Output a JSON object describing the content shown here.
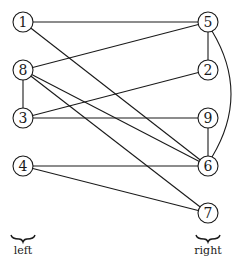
{
  "diagram": {
    "type": "bipartite-graph",
    "stroke_color": "#1a1a1a",
    "background": "#ffffff",
    "node_radius": 10,
    "nodes": [
      {
        "id": "1",
        "label": "1",
        "side": "left",
        "x": 23,
        "y": 22
      },
      {
        "id": "8",
        "label": "8",
        "side": "left",
        "x": 23,
        "y": 70
      },
      {
        "id": "3",
        "label": "3",
        "side": "left",
        "x": 23,
        "y": 118
      },
      {
        "id": "4",
        "label": "4",
        "side": "left",
        "x": 23,
        "y": 166
      },
      {
        "id": "5",
        "label": "5",
        "side": "right",
        "x": 208,
        "y": 22
      },
      {
        "id": "2",
        "label": "2",
        "side": "right",
        "x": 208,
        "y": 70
      },
      {
        "id": "9",
        "label": "9",
        "side": "right",
        "x": 208,
        "y": 118
      },
      {
        "id": "6",
        "label": "6",
        "side": "right",
        "x": 208,
        "y": 166
      },
      {
        "id": "7",
        "label": "7",
        "side": "right",
        "x": 208,
        "y": 213
      }
    ],
    "edges": [
      {
        "from": "1",
        "to": "5"
      },
      {
        "from": "1",
        "to": "6"
      },
      {
        "from": "8",
        "to": "5"
      },
      {
        "from": "8",
        "to": "3"
      },
      {
        "from": "8",
        "to": "6"
      },
      {
        "from": "8",
        "to": "7"
      },
      {
        "from": "3",
        "to": "2"
      },
      {
        "from": "3",
        "to": "9"
      },
      {
        "from": "4",
        "to": "6"
      },
      {
        "from": "4",
        "to": "7"
      },
      {
        "from": "5",
        "to": "2"
      },
      {
        "from": "5",
        "to": "6",
        "curved": true
      },
      {
        "from": "9",
        "to": "6"
      }
    ],
    "groups": [
      {
        "label": "left",
        "x": 23,
        "brace_y": 238,
        "label_y": 254
      },
      {
        "label": "right",
        "x": 208,
        "brace_y": 238,
        "label_y": 254
      }
    ]
  }
}
